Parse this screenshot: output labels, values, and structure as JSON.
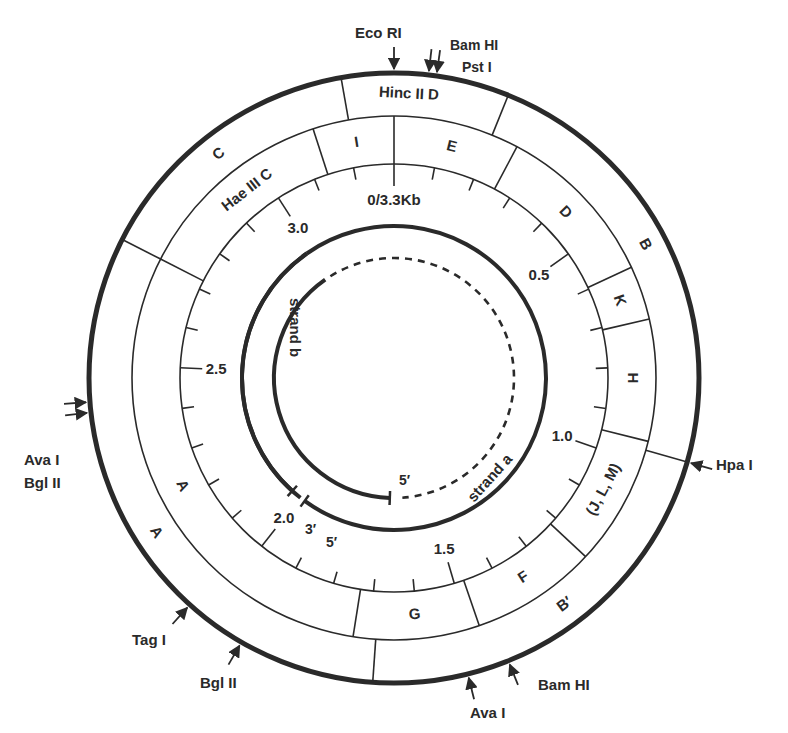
{
  "diagram": {
    "center": [
      394,
      378
    ],
    "colors": {
      "ink": "#2a2a2a",
      "background": "#ffffff"
    },
    "radii": {
      "outer": 305,
      "ring2": 262,
      "scale": 214,
      "strand_outer": 152,
      "strand_inner": 120
    },
    "scale": {
      "unit": "Kb",
      "total_kb": 3.3,
      "degrees_per_kb": 109.1,
      "labels": [
        {
          "kb": 0,
          "text": "0/3.3Kb"
        },
        {
          "kb": 0.5,
          "text": "0.5"
        },
        {
          "kb": 1.0,
          "text": "1.0"
        },
        {
          "kb": 1.5,
          "text": "1.5"
        },
        {
          "kb": 2.0,
          "text": "2.0"
        },
        {
          "kb": 2.5,
          "text": "2.5"
        },
        {
          "kb": 3.0,
          "text": "3.0"
        }
      ],
      "tick_step_kb": 0.1
    },
    "outer_ring": {
      "enzyme": "Hinc II",
      "boundaries_deg": [
        -10,
        22,
        106,
        184,
        297
      ],
      "fragments": [
        {
          "text": "Hinc II D",
          "deg": 3,
          "r": 284
        },
        {
          "text": "B",
          "deg": 62,
          "r": 284
        },
        {
          "text": "B′",
          "deg": 143,
          "r": 284
        },
        {
          "text": "A",
          "deg": 237,
          "r": 284
        },
        {
          "text": "C",
          "deg": 322,
          "r": 284
        }
      ]
    },
    "middle_ring": {
      "enzyme": "Hae III",
      "boundaries_deg": [
        -18,
        0,
        28,
        65,
        77,
        104,
        133,
        161,
        189,
        297
      ],
      "fragments": [
        {
          "text": "I",
          "deg": -9,
          "r": 238
        },
        {
          "text": "E",
          "deg": 14,
          "r": 238
        },
        {
          "text": "D",
          "deg": 46,
          "r": 238
        },
        {
          "text": "K",
          "deg": 71,
          "r": 238
        },
        {
          "text": "H",
          "deg": 90,
          "r": 238
        },
        {
          "text": "(J, L, M)",
          "deg": 118,
          "r": 238
        },
        {
          "text": "F",
          "deg": 147,
          "r": 238
        },
        {
          "text": "G",
          "deg": 175,
          "r": 238
        },
        {
          "text": "A",
          "deg": 243,
          "r": 238
        },
        {
          "text": "Hae III  C",
          "deg": 322,
          "r": 238
        }
      ]
    },
    "sites": [
      {
        "text": "Eco RI",
        "deg": 0,
        "side": "top"
      },
      {
        "text": "Bam HI",
        "deg": 6.5,
        "side": "top"
      },
      {
        "text": "Pst I",
        "deg": 8,
        "side": "top"
      },
      {
        "text": "Hpa I",
        "deg": 106,
        "side": "right"
      },
      {
        "text": "Bam HI",
        "deg": 158,
        "side": "bottom"
      },
      {
        "text": "Ava I",
        "deg": 166,
        "side": "bottom"
      },
      {
        "text": "Bgl II",
        "deg": 210,
        "side": "bottom"
      },
      {
        "text": "Tag I",
        "deg": 222,
        "side": "left"
      },
      {
        "text": "Ava I",
        "deg": 263.5,
        "side": "left"
      },
      {
        "text": "Bgl II",
        "deg": 265.5,
        "side": "left"
      }
    ],
    "strands": {
      "strand_a": {
        "label": "strand a",
        "solid_from_deg": 145,
        "solid_to_deg": 216,
        "dashed_from_deg": -35,
        "dashed_to_deg": 145,
        "end_5": "5′"
      },
      "strand_b": {
        "label": "strand b",
        "solid_from_deg": 218,
        "solid_to_deg": 325,
        "end_3": "3′",
        "end_5": "5′"
      }
    }
  },
  "site_labels": {
    "eco_ri": "Eco RI",
    "bam_hi_top": "Bam HI",
    "pst_i": "Pst I",
    "hpa_i": "Hpa I",
    "bam_hi_bottom": "Bam HI",
    "ava_i_bottom": "Ava I",
    "bgl_ii_bottom": "Bgl II",
    "tag_i": "Tag I",
    "ava_i_left": "Ava I",
    "bgl_ii_left": "Bgl II"
  },
  "strand_labels": {
    "a": "strand a",
    "b": "strand b",
    "five_prime_inner": "5′",
    "three_prime": "3′",
    "five_prime_outer": "5′"
  }
}
